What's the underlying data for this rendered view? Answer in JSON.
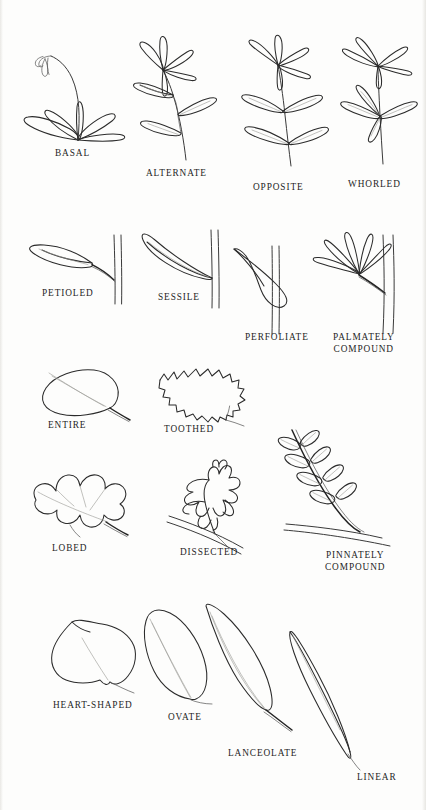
{
  "figure": {
    "style": "pen-and-ink botanical line drawings, uncolored",
    "background_color": "#fdfdfc",
    "ink_color": "#2b2b2b",
    "vein_color": "#9a9a96"
  },
  "rows": [
    {
      "group": "leaf arrangement on stem",
      "items": [
        {
          "label": "BASAL",
          "description": "rosette of strap-like leaves radiating from ground level with a tall arching flowering stalk"
        },
        {
          "label": "ALTERNATE",
          "description": "leaves borne singly at staggered nodes alternating along the stem, terminal cluster at top"
        },
        {
          "label": "OPPOSITE",
          "description": "leaves borne in pairs directly across from each other at each node"
        },
        {
          "label": "WHORLED",
          "description": "three or more leaves radiating from a single node in a ring"
        }
      ]
    },
    {
      "group": "leaf attachment",
      "items": [
        {
          "label": "PETIOLED",
          "description": "blade attached to the stem by a distinct stalk (petiole)"
        },
        {
          "label": "SESSILE",
          "description": "blade attached directly to the stem with no stalk"
        },
        {
          "label": "PERFOLIATE",
          "description": "leaf base surrounds the stem so the stem appears to pass through the blade"
        },
        {
          "label": "PALMATELY COMPOUND",
          "label_lines": [
            "PALMATELY",
            "COMPOUND"
          ],
          "description": "leaflets radiating like fingers from the tip of a single petiole"
        }
      ]
    },
    {
      "group": "leaf margin",
      "items": [
        {
          "label": "ENTIRE",
          "description": "smooth unbroken leaf margin"
        },
        {
          "label": "TOOTHED",
          "description": "margin cut into small sharp saw-like teeth"
        }
      ]
    },
    {
      "group": "leaf division",
      "items": [
        {
          "label": "LOBED",
          "description": "margin with deep rounded lobes, oak-like"
        },
        {
          "label": "DISSECTED",
          "description": "blade deeply cut into narrow irregular segments"
        },
        {
          "label": "PINNATELY COMPOUND",
          "label_lines": [
            "PINNATELY",
            "COMPOUND"
          ],
          "description": "paired leaflets arranged along both sides of a central rachis"
        }
      ]
    },
    {
      "group": "leaf shape",
      "items": [
        {
          "label": "HEART-SHAPED",
          "description": "cordate blade, broad with a notched base"
        },
        {
          "label": "OVATE",
          "description": "egg-shaped blade, broadest below the middle"
        },
        {
          "label": "LANCEOLATE",
          "description": "lance-shaped blade, several times longer than wide, tapering to a point"
        },
        {
          "label": "LINEAR",
          "description": "very long narrow blade with nearly parallel sides"
        }
      ]
    }
  ]
}
